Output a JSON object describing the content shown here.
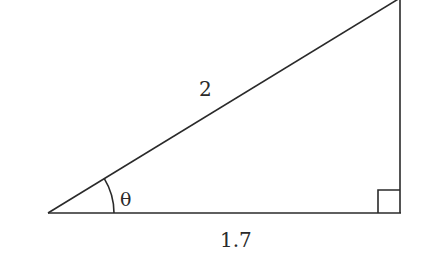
{
  "diagram": {
    "type": "right-triangle",
    "hypotenuse_label": "2",
    "adjacent_label": "1.7",
    "angle_label": "θ",
    "right_angle_marker": true,
    "stroke_color": "#2a2a2a"
  }
}
